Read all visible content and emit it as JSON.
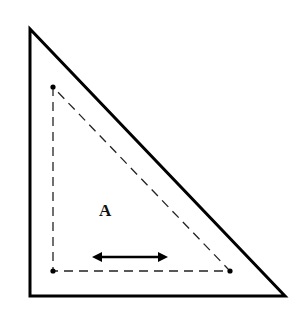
{
  "diagram": {
    "label": "A",
    "outer_triangle": {
      "points": [
        [
          30,
          29
        ],
        [
          30,
          296
        ],
        [
          285,
          296
        ]
      ],
      "stroke": "#000000",
      "style": "solid"
    },
    "inner_triangle": {
      "points": [
        [
          53,
          87
        ],
        [
          53,
          271
        ],
        [
          230,
          271
        ]
      ],
      "stroke": "#000000",
      "style": "dashed"
    },
    "vertex_dots": [
      [
        53,
        87
      ],
      [
        53,
        271
      ],
      [
        230,
        271
      ]
    ],
    "arrow": {
      "from": [
        92,
        257
      ],
      "to": [
        168,
        257
      ],
      "type": "double-headed"
    },
    "colors": {
      "line": "#000000",
      "background": "#ffffff"
    }
  }
}
